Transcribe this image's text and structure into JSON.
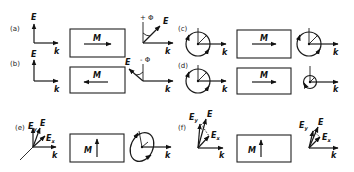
{
  "figure": {
    "panels": [
      {
        "id": "a",
        "label": "(a)",
        "magnetization_label": "M",
        "magnetization_direction": "right",
        "input_field": "E",
        "output_angle_label": "+ Φ",
        "output_field": "E"
      },
      {
        "id": "b",
        "label": "(b)",
        "magnetization_label": "M",
        "magnetization_direction": "left",
        "input_field": "E",
        "output_angle_label": "- Φ",
        "output_field": "E"
      },
      {
        "id": "c",
        "label": "(c)",
        "magnetization_label": "M",
        "magnetization_direction": "right"
      },
      {
        "id": "d",
        "label": "(d)",
        "magnetization_label": "M",
        "magnetization_direction": "right"
      },
      {
        "id": "e",
        "label": "(e)",
        "magnetization_label": "M",
        "magnetization_direction": "up",
        "field_labels": [
          "E",
          "Ey",
          "Ex"
        ]
      },
      {
        "id": "f",
        "label": "(f)",
        "magnetization_label": "M",
        "magnetization_direction": "up",
        "field_labels": [
          "E",
          "Ey",
          "Ex"
        ]
      }
    ],
    "axis_labels": {
      "wavevector": "k",
      "field": "E"
    },
    "sub_labels": {
      "y": "y",
      "x": "x"
    }
  }
}
